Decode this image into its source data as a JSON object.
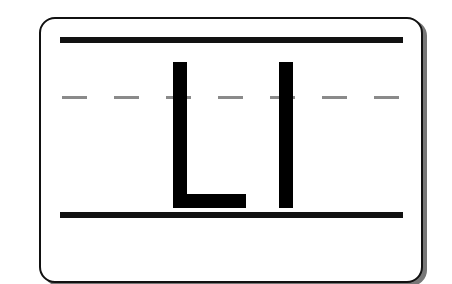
{
  "card": {
    "letters": "LI",
    "guidelines": {
      "top": "solid",
      "middle": "dashed",
      "bottom": "solid"
    },
    "colors": {
      "ink": "#000000",
      "rule": "#111111",
      "dash": "#8a8a8a",
      "background": "#ffffff",
      "shadow": "#777777"
    }
  }
}
